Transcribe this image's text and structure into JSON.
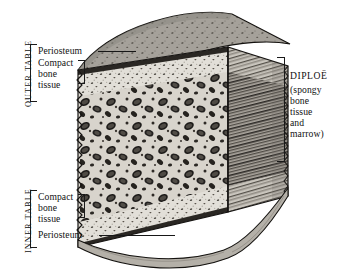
{
  "figure": {
    "background_color": "#ffffff",
    "ink_color": "#141414"
  },
  "labels": {
    "outer_table": "OUTER TABLE",
    "inner_table": "INNER TABLE",
    "periosteum_outer": "Periosteum",
    "compact_bone_outer": "Compact\nbone\ntissue",
    "compact_bone_outer_lines": [
      "Compact",
      "bone",
      "tissue"
    ],
    "compact_bone_inner_lines": [
      "Compact",
      "bone",
      "tissue"
    ],
    "periosteum_inner": "Periosteum",
    "diploe_title": "DIPLOË",
    "diploe_detail_lines": [
      "(spongy",
      "bone",
      "tissue",
      "and",
      "marrow)"
    ]
  },
  "anatomy": {
    "layers": [
      {
        "name": "Periosteum (outer)",
        "position": "outer surface",
        "tone": "#3a3a3a"
      },
      {
        "name": "Compact bone tissue (outer table)",
        "position": "below outer periosteum",
        "tone": "#dcd9d2"
      },
      {
        "name": "Diploe - spongy bone tissue and marrow",
        "position": "middle",
        "tone": "#b9b5ad"
      },
      {
        "name": "Compact bone tissue (inner table)",
        "position": "above inner periosteum",
        "tone": "#dcd9d2"
      },
      {
        "name": "Periosteum (inner)",
        "position": "inner surface",
        "tone": "#3a3a3a"
      }
    ]
  },
  "icons": {
    "bracket_left": "bracket-icon",
    "bracket_right": "bracket-icon",
    "leader_line": "leader-line-icon"
  }
}
